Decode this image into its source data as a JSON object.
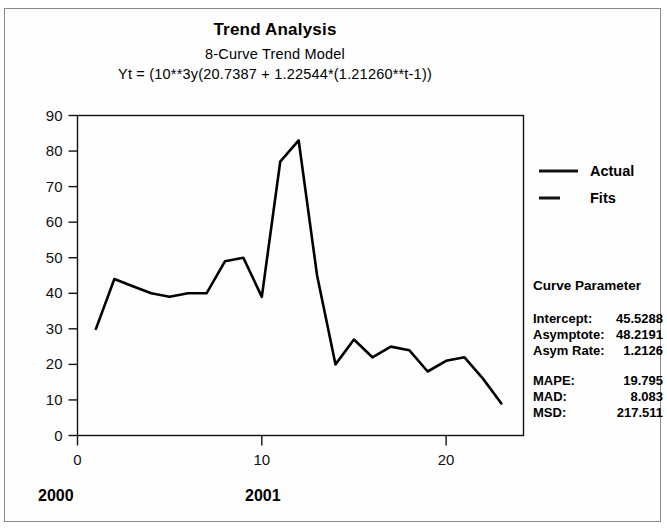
{
  "window": {
    "title": "Trend Analysis"
  },
  "header": {
    "title": "Trend Analysis",
    "subtitle": "8-Curve Trend Model",
    "equation": "Yt = (10**3y(20.7387 + 1.22544*(1.21260**t-1))"
  },
  "legend": {
    "position": "right",
    "entries": [
      {
        "label": "Actual",
        "style": "solid",
        "color": "#000000"
      },
      {
        "label": "Fits",
        "style": "dash",
        "color": "#000000"
      }
    ]
  },
  "panel": {
    "heading": "Curve Parameter",
    "params": [
      {
        "key": "Intercept:",
        "value": "45.5288"
      },
      {
        "key": "Asymptote:",
        "value": "48.2191"
      },
      {
        "key": "Asym Rate:",
        "value": "1.2126"
      }
    ],
    "accuracy": [
      {
        "key": "MAPE:",
        "value": "19.795"
      },
      {
        "key": "MAD:",
        "value": "8.083"
      },
      {
        "key": "MSD:",
        "value": "217.511"
      }
    ]
  },
  "period_labels": [
    {
      "label": "2000",
      "x_unit": 0.5
    },
    {
      "label": "2001",
      "x_unit": 9.5
    }
  ],
  "chart_data": {
    "type": "line",
    "title": "Trend Analysis",
    "subtitle": "8-Curve Trend Model",
    "annotation": "Yt = (10**3y(20.7387 + 1.22544*(1.21260**t-1))",
    "xlabel": "",
    "ylabel": "",
    "xlim": [
      0,
      24.2
    ],
    "ylim": [
      0,
      90
    ],
    "xticks": [
      0,
      10,
      20
    ],
    "yticks": [
      0,
      10,
      20,
      30,
      40,
      50,
      60,
      70,
      80,
      90
    ],
    "grid": false,
    "legend_position": "right",
    "series": [
      {
        "name": "Actual",
        "color": "#000000",
        "style": "solid",
        "x": [
          1,
          2,
          3,
          4,
          5,
          6,
          7,
          8,
          9,
          10,
          11,
          12,
          13,
          14,
          15,
          16,
          17,
          18,
          19,
          20,
          21,
          22,
          23
        ],
        "values": [
          30,
          44,
          42,
          40,
          39,
          40,
          40,
          49,
          50,
          39,
          77,
          83,
          45,
          20,
          27,
          22,
          25,
          24,
          18,
          21,
          22,
          16,
          9
        ]
      }
    ]
  }
}
